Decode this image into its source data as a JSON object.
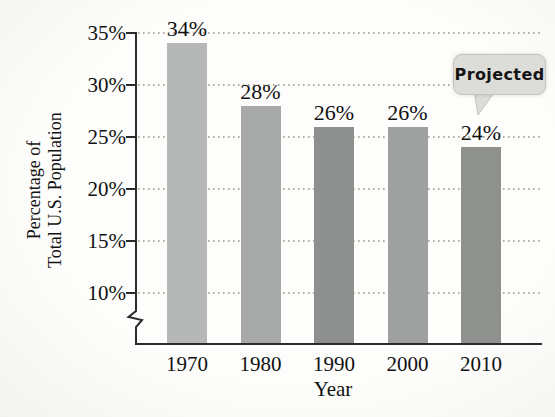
{
  "chart_data": {
    "type": "bar",
    "title": "",
    "categories": [
      "1970",
      "1980",
      "1990",
      "2000",
      "2010"
    ],
    "values": [
      34,
      28,
      26,
      26,
      24
    ],
    "bar_labels": [
      "34%",
      "28%",
      "26%",
      "26%",
      "24%"
    ],
    "bar_colors": [
      "#b6b8b7",
      "#a8aaa9",
      "#8e908f",
      "#9fa1a0",
      "#8f918f"
    ],
    "xlabel": "Year",
    "ylabel": "Percentage of Total U.S. Population",
    "ylabel_line1": "Percentage of",
    "ylabel_line2": "Total U.S. Population",
    "ytick_labels": [
      "35%",
      "30%",
      "25%",
      "20%",
      "15%",
      "10%"
    ],
    "ytick_values": [
      35,
      30,
      25,
      20,
      15,
      10
    ],
    "ylim": [
      10,
      35
    ],
    "axis_break": true,
    "grid": "dotted-horizontal",
    "legend": "none",
    "annotation": {
      "text": "Projected",
      "target_category": "2010"
    },
    "colors": {
      "axis": "#2b2b2b",
      "gridline": "#9a9287",
      "text": "#111111",
      "bubble_fill": "#dcdcd9",
      "bubble_border": "#c2c2bf"
    }
  }
}
